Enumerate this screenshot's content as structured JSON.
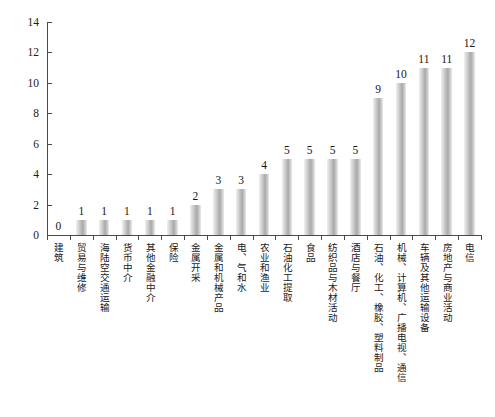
{
  "chart_data": {
    "type": "bar",
    "title": "",
    "subtitle": "",
    "xlabel": "",
    "ylabel": "",
    "ylim": [
      0,
      14
    ],
    "yticks": [
      0,
      2,
      4,
      6,
      8,
      10,
      12,
      14
    ],
    "grid": false,
    "legend": null,
    "bar_color": "#b9b9b9",
    "categories": [
      "建筑",
      "贸易与维修",
      "海陆空交通运输",
      "货币中介",
      "其他金融中介",
      "保险",
      "金属开采",
      "金属和机械产品",
      "电、气和水",
      "农业和渔业",
      "石油化工提取",
      "食品",
      "纺织品与木材活动",
      "酒店与餐厅",
      "石油、化工、橡胶、塑料制品",
      "机械、计算机、广播电视、通信",
      "车辆及其他运输设备",
      "房地产与商业活动",
      "电信"
    ],
    "values": [
      0,
      1,
      1,
      1,
      1,
      1,
      2,
      3,
      3,
      4,
      5,
      5,
      5,
      5,
      9,
      10,
      11,
      11,
      12
    ],
    "value_labels": [
      "0",
      "1",
      "1",
      "1",
      "1",
      "1",
      "2",
      "3",
      "3",
      "4",
      "5",
      "5",
      "5",
      "5",
      "9",
      "10",
      "11",
      "11",
      "12"
    ]
  }
}
